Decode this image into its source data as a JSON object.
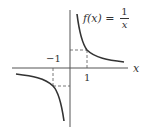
{
  "diagram": {
    "function_label_prefix": "f(x) =",
    "function_numerator": "1",
    "function_denominator": "x",
    "x_axis_label": "x",
    "tick_neg_one": "−1",
    "tick_one": "1",
    "curve_color": "#333333",
    "axis_color": "#555555"
  }
}
